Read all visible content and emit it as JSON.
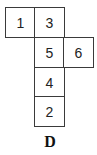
{
  "diagram": {
    "type": "cube-net",
    "label": "D",
    "cells": [
      {
        "value": "1",
        "col": 0,
        "row": 0
      },
      {
        "value": "3",
        "col": 1,
        "row": 0
      },
      {
        "value": "5",
        "col": 1,
        "row": 1
      },
      {
        "value": "6",
        "col": 2,
        "row": 1
      },
      {
        "value": "4",
        "col": 1,
        "row": 2
      },
      {
        "value": "2",
        "col": 1,
        "row": 3
      }
    ]
  }
}
